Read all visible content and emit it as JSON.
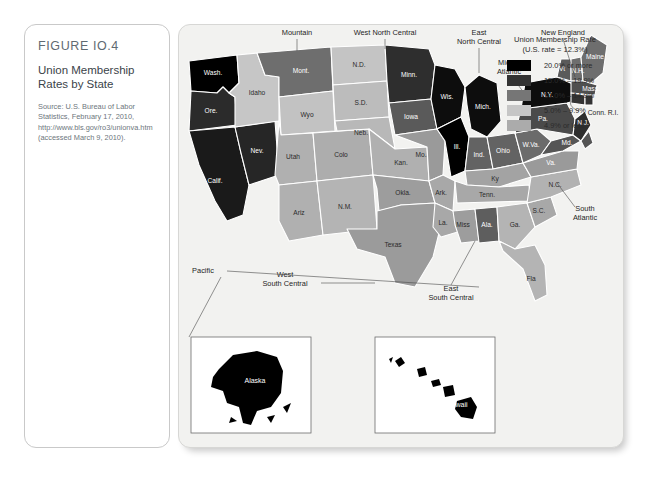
{
  "figure": {
    "number": "FIGURE IO.4",
    "title": "Union Membership Rates by State",
    "source": "Source: U.S. Bureau of Labor Statistics, February 17, 2010, http://www.bls.gov/ro3/unionva.htm (accessed March 9, 2010)."
  },
  "legend": {
    "title_line1": "Union Membership Rate",
    "title_line2": "(U.S. rate = 12.3%)",
    "items": [
      {
        "label": "20.0% or more",
        "color": "#000000"
      },
      {
        "label": "15.0% – 19.9%",
        "color": "#333333"
      },
      {
        "label": "10.0% – 14.9%",
        "color": "#767676"
      },
      {
        "label": "5.0% – 9.9%",
        "color": "#c6c6c6"
      },
      {
        "label": "4.9% or less",
        "color": "#ababab"
      }
    ]
  },
  "map": {
    "region_labels": [
      {
        "name": "Mountain",
        "text": "Mountain"
      },
      {
        "name": "West North Central",
        "text": "West North Central"
      },
      {
        "name": "East North Central",
        "text": "East North Central"
      },
      {
        "name": "New England",
        "text": "New England"
      },
      {
        "name": "Middle Atlantic",
        "text": "Middle Atlantic"
      },
      {
        "name": "South Atlantic",
        "text": "South Atlantic"
      },
      {
        "name": "East South Central",
        "text": "East South Central"
      },
      {
        "name": "West South Central",
        "text": "West South Central"
      },
      {
        "name": "Pacific",
        "text": "Pacific"
      }
    ],
    "region_label_text": {
      "mountain": "Mountain",
      "west_north_central_1": "West North Central",
      "east_north_central_1": "East",
      "east_north_central_2": "North Central",
      "new_england": "New England",
      "middle_atlantic_1": "Middle",
      "middle_atlantic_2": "Atlantic",
      "south_atlantic_1": "South",
      "south_atlantic_2": "Atlantic",
      "east_south_central_1": "East",
      "east_south_central_2": "South Central",
      "west_south_central_1": "West",
      "west_south_central_2": "South Central",
      "pacific": "Pacific"
    },
    "states": [
      {
        "abbr": "Wash.",
        "name": "Washington",
        "category": "20.0% or more",
        "color": "#000000"
      },
      {
        "abbr": "Ore.",
        "name": "Oregon",
        "category": "15.0% – 19.9%",
        "color": "#2b2b2b"
      },
      {
        "abbr": "Calif.",
        "name": "California",
        "category": "15.0% – 19.9%",
        "color": "#1a1a1a"
      },
      {
        "abbr": "Nev.",
        "name": "Nevada",
        "category": "15.0% – 19.9%",
        "color": "#262626"
      },
      {
        "abbr": "Idaho",
        "name": "Idaho",
        "category": "5.0% – 9.9%",
        "color": "#c6c6c6"
      },
      {
        "abbr": "Mont.",
        "name": "Montana",
        "category": "10.0% – 14.9%",
        "color": "#6e6e6e"
      },
      {
        "abbr": "Wyo",
        "name": "Wyoming",
        "category": "5.0% – 9.9%",
        "color": "#c2c2c2"
      },
      {
        "abbr": "Utah",
        "name": "Utah",
        "category": "4.9% or less",
        "color": "#b0b0b0"
      },
      {
        "abbr": "Colo",
        "name": "Colorado",
        "category": "4.9% or less",
        "color": "#adadad"
      },
      {
        "abbr": "Ariz",
        "name": "Arizona",
        "category": "4.9% or less",
        "color": "#b0b0b0"
      },
      {
        "abbr": "N.M.",
        "name": "New Mexico",
        "category": "5.0% – 9.9%",
        "color": "#b4b4b4"
      },
      {
        "abbr": "N.D.",
        "name": "North Dakota",
        "category": "5.0% – 9.9%",
        "color": "#c4c4c4"
      },
      {
        "abbr": "S.D.",
        "name": "South Dakota",
        "category": "4.9% or less",
        "color": "#bcbcbc"
      },
      {
        "abbr": "Neb.",
        "name": "Nebraska",
        "category": "4.9% or less",
        "color": "#b8b8b8"
      },
      {
        "abbr": "Kan.",
        "name": "Kansas",
        "category": "4.9% or less",
        "color": "#b0b0b0"
      },
      {
        "abbr": "Okla.",
        "name": "Oklahoma",
        "category": "4.9% or less",
        "color": "#9d9d9d"
      },
      {
        "abbr": "Texas",
        "name": "Texas",
        "category": "4.9% or less",
        "color": "#9b9b9b"
      },
      {
        "abbr": "Minn.",
        "name": "Minnesota",
        "category": "15.0% – 19.9%",
        "color": "#2e2e2e"
      },
      {
        "abbr": "Iowa",
        "name": "Iowa",
        "category": "10.0% – 14.9%",
        "color": "#5a5a5a"
      },
      {
        "abbr": "Mo.",
        "name": "Missouri",
        "category": "10.0% – 14.9%",
        "color": "#9a9a9a"
      },
      {
        "abbr": "Ark.",
        "name": "Arkansas",
        "category": "4.9% or less",
        "color": "#a8a8a8"
      },
      {
        "abbr": "La.",
        "name": "Louisiana",
        "category": "4.9% or less",
        "color": "#a8a8a8"
      },
      {
        "abbr": "Wis.",
        "name": "Wisconsin",
        "category": "20.0% or more",
        "color": "#0d0d0d"
      },
      {
        "abbr": "Ill.",
        "name": "Illinois",
        "category": "20.0% or more",
        "color": "#000000"
      },
      {
        "abbr": "Mich.",
        "name": "Michigan",
        "category": "20.0% or more",
        "color": "#0d0d0d"
      },
      {
        "abbr": "Ind.",
        "name": "Indiana",
        "category": "10.0% – 14.9%",
        "color": "#636363"
      },
      {
        "abbr": "Ohio",
        "name": "Ohio",
        "category": "10.0% – 14.9%",
        "color": "#636363"
      },
      {
        "abbr": "Ky",
        "name": "Kentucky",
        "category": "5.0% – 9.9%",
        "color": "#a3a3a3"
      },
      {
        "abbr": "Tenn.",
        "name": "Tennessee",
        "category": "5.0% – 9.9%",
        "color": "#a8a8a8"
      },
      {
        "abbr": "Miss",
        "name": "Mississippi",
        "category": "5.0% – 9.9%",
        "color": "#9d9d9d"
      },
      {
        "abbr": "Ala.",
        "name": "Alabama",
        "category": "10.0% – 14.9%",
        "color": "#5e5e5e"
      },
      {
        "abbr": "Ga.",
        "name": "Georgia",
        "category": "4.9% or less",
        "color": "#b4b4b4"
      },
      {
        "abbr": "Fla",
        "name": "Florida",
        "category": "4.9% or less",
        "color": "#b4b4b4"
      },
      {
        "abbr": "S.C.",
        "name": "South Carolina",
        "category": "4.9% or less",
        "color": "#a8a8a8"
      },
      {
        "abbr": "N.C.",
        "name": "North Carolina",
        "category": "4.9% or less",
        "color": "#b2b2b2"
      },
      {
        "abbr": "Va.",
        "name": "Virginia",
        "category": "5.0% – 9.9%",
        "color": "#9a9a9a"
      },
      {
        "abbr": "W.Va.",
        "name": "West Virginia",
        "category": "10.0% – 14.9%",
        "color": "#6b6b6b"
      },
      {
        "abbr": "Md.",
        "name": "Maryland",
        "category": "10.0% – 14.9%",
        "color": "#555555"
      },
      {
        "abbr": "Pa.",
        "name": "Pennsylvania",
        "category": "10.0% – 14.9%",
        "color": "#4a4a4a"
      },
      {
        "abbr": "N.Y.",
        "name": "New York",
        "category": "20.0% or more",
        "color": "#0d0d0d"
      },
      {
        "abbr": "Vt",
        "name": "Vermont",
        "category": "10.0% – 14.9%",
        "color": "#5a5a5a"
      },
      {
        "abbr": "N.H.",
        "name": "New Hampshire",
        "category": "10.0% – 14.9%",
        "color": "#6e6e6e"
      },
      {
        "abbr": "Maine",
        "name": "Maine",
        "category": "10.0% – 14.9%",
        "color": "#6e6e6e"
      },
      {
        "abbr": "Mass.",
        "name": "Massachusetts",
        "category": "10.0% – 14.9%",
        "color": "#4f4f4f"
      },
      {
        "abbr": "Conn.",
        "name": "Connecticut",
        "category": "15.0% – 19.9%",
        "color": "#333333"
      },
      {
        "abbr": "R.I.",
        "name": "Rhode Island",
        "category": "15.0% – 19.9%",
        "color": "#333333"
      },
      {
        "abbr": "N.J.",
        "name": "New Jersey",
        "category": "15.0% – 19.9%",
        "color": "#2e2e2e"
      },
      {
        "abbr": "Del.",
        "name": "Delaware",
        "category": "10.0% – 14.9%",
        "color": "#555555"
      },
      {
        "abbr": "Alaska",
        "name": "Alaska",
        "category": "20.0% or more",
        "color": "#000000"
      },
      {
        "abbr": "Hawaii",
        "name": "Hawaii",
        "category": "20.0% or more",
        "color": "#000000"
      }
    ],
    "inset_labels": {
      "alaska": "Alaska",
      "hawaii": "Hawaii"
    },
    "connector_labels": {
      "conn_ri": "Conn. R.I."
    }
  }
}
